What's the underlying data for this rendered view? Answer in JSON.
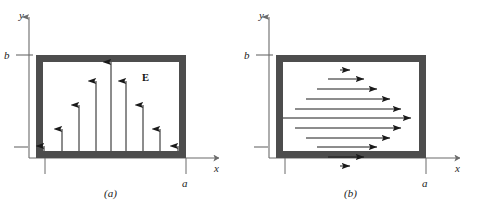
{
  "figure": {
    "background_color": "#ffffff",
    "frame_color": "#4d4d4d",
    "frame_inner_color": "#ffffff",
    "axis_color": "#6b6b6b",
    "arrow_color": "#1a1a1a"
  },
  "panels": [
    {
      "tag": "(a)",
      "name": "panel-a",
      "field_label": "E",
      "axis": {
        "x_label": "x",
        "y_label": "y",
        "x_tick_label": "a",
        "y_tick_label": "b"
      },
      "box": {
        "x": 36,
        "y": 55,
        "width": 150,
        "height": 103,
        "border": 7
      },
      "field_direction": "up",
      "arrows": [
        {
          "x": 44,
          "length": 5
        },
        {
          "x": 62,
          "length": 22
        },
        {
          "x": 79,
          "length": 46
        },
        {
          "x": 96,
          "length": 70
        },
        {
          "x": 111,
          "length": 89
        },
        {
          "x": 126,
          "length": 70
        },
        {
          "x": 143,
          "length": 46
        },
        {
          "x": 160,
          "length": 22
        },
        {
          "x": 178,
          "length": 5
        }
      ]
    },
    {
      "tag": "(b)",
      "name": "panel-b",
      "field_label": "",
      "axis": {
        "x_label": "x",
        "y_label": "y",
        "x_tick_label": "a",
        "y_tick_label": "b"
      },
      "box": {
        "x": 36,
        "y": 55,
        "width": 150,
        "height": 103,
        "border": 7
      },
      "field_direction": "right",
      "arrows": [
        {
          "y": 8,
          "length": 10
        },
        {
          "y": 17,
          "length": 36
        },
        {
          "y": 27,
          "length": 60
        },
        {
          "y": 37,
          "length": 84
        },
        {
          "y": 47,
          "length": 106
        },
        {
          "y": 56,
          "length": 128
        },
        {
          "y": 66,
          "length": 106
        },
        {
          "y": 76,
          "length": 84
        },
        {
          "y": 85,
          "length": 60
        },
        {
          "y": 95,
          "length": 36
        },
        {
          "y": 104,
          "length": 10
        }
      ]
    }
  ]
}
